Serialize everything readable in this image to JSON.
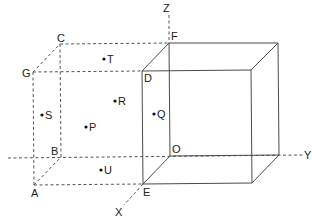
{
  "diagram": {
    "title": "",
    "axes": {
      "x": {
        "label": "X"
      },
      "y": {
        "label": "Y"
      },
      "z": {
        "label": "Z"
      }
    },
    "vertices": {
      "origin": "O",
      "a": "A",
      "b": "B",
      "c": "C",
      "d": "D",
      "e": "E",
      "f": "F",
      "g": "G"
    },
    "points": [
      {
        "label": "T"
      },
      {
        "label": "R"
      },
      {
        "label": "S"
      },
      {
        "label": "P"
      },
      {
        "label": "Q"
      },
      {
        "label": "U"
      }
    ]
  }
}
